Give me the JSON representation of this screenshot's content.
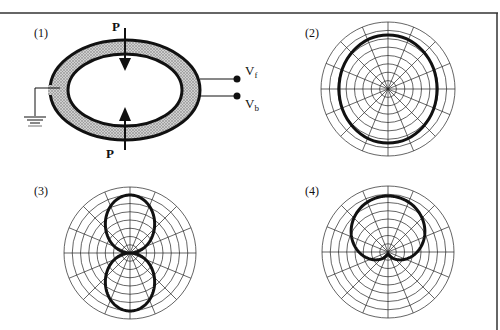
{
  "figure": {
    "panels": [
      {
        "label": "(1)",
        "type": "sensor-schematic",
        "force_label_top": "P",
        "force_label_bottom": "P",
        "terminal_front": "V",
        "terminal_front_sub": "f",
        "terminal_back": "V",
        "terminal_back_sub": "b"
      },
      {
        "label": "(2)",
        "type": "polar-pattern",
        "pattern": "omnidirectional"
      },
      {
        "label": "(3)",
        "type": "polar-pattern",
        "pattern": "figure-eight"
      },
      {
        "label": "(4)",
        "type": "polar-pattern",
        "pattern": "cardioid"
      }
    ],
    "polar_grid": {
      "rings": 8,
      "spokes": 16
    },
    "colors": {
      "line": "#111111",
      "grid": "#222222",
      "ring_fill": "#b8b8b8",
      "background": "#ffffff"
    }
  }
}
